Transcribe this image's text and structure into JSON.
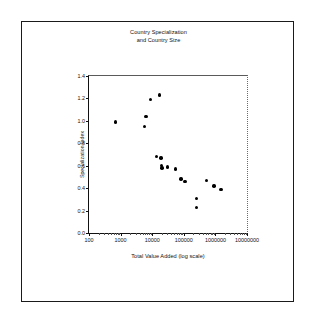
{
  "chart_data": {
    "type": "scatter",
    "title": "Country Specialization and Country Size",
    "title_lines": [
      "Country Specialization",
      "and Country Size"
    ],
    "xlabel": "Total Value Added (log scale)",
    "ylabel": "Specialization Index",
    "xscale": "log",
    "yscale": "linear",
    "xlim": [
      100,
      10000000
    ],
    "ylim": [
      0.0,
      1.4
    ],
    "grid": false,
    "legend": false,
    "xticks": [
      100,
      1000,
      10000,
      100000,
      1000000,
      10000000
    ],
    "xticklabels": [
      "100",
      "1000",
      "10000",
      "100000",
      "1000000",
      "10000000"
    ],
    "yticks": [
      0.0,
      0.2,
      0.4,
      0.6,
      0.8,
      1.0,
      1.2,
      1.4
    ],
    "yticklabels": [
      "0.0",
      "0.2",
      "0.4",
      "0.6",
      "0.8",
      "1.0",
      "1.2",
      "1.4"
    ],
    "marker": "filled-circle",
    "marker_color": "#000000",
    "series": [
      {
        "name": "Countries",
        "points": [
          {
            "x": 700,
            "y": 0.99
          },
          {
            "x": 5600,
            "y": 0.95
          },
          {
            "x": 6300,
            "y": 1.04
          },
          {
            "x": 9000,
            "y": 1.19
          },
          {
            "x": 17000,
            "y": 1.23
          },
          {
            "x": 13500,
            "y": 0.68
          },
          {
            "x": 19000,
            "y": 0.67
          },
          {
            "x": 20000,
            "y": 0.6
          },
          {
            "x": 20500,
            "y": 0.58
          },
          {
            "x": 30000,
            "y": 0.59
          },
          {
            "x": 55000,
            "y": 0.57
          },
          {
            "x": 82000,
            "y": 0.48
          },
          {
            "x": 110000,
            "y": 0.46
          },
          {
            "x": 250000,
            "y": 0.31
          },
          {
            "x": 255000,
            "y": 0.23
          },
          {
            "x": 520000,
            "y": 0.47
          },
          {
            "x": 900000,
            "y": 0.42
          },
          {
            "x": 1500000,
            "y": 0.39
          }
        ]
      }
    ]
  }
}
